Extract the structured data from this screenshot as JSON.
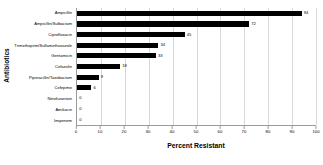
{
  "chart_data": {
    "type": "bar",
    "orientation": "horizontal",
    "title": "",
    "xlabel": "Percent Resistant",
    "ylabel": "Antibiotics",
    "categories": [
      "Ampicillin",
      "Ampicillin/Sulbactam",
      "Ciprofloxacin",
      "Trimethoprim/Sulfamethoxazole",
      "Gentamicin",
      "Cefazolin",
      "Piperacillin/Tazobactam",
      "Cefepime",
      "Nitrofurantoin",
      "Amikacin",
      "Imipenem"
    ],
    "values": [
      94,
      72,
      45,
      34,
      33,
      18,
      9,
      6,
      0,
      0,
      0
    ],
    "value_labels": [
      "94",
      "72",
      "45",
      "34",
      "33",
      "18",
      "9",
      "6",
      "0",
      "0",
      "0"
    ],
    "xlim": [
      0,
      100
    ],
    "xticks": [
      0,
      10,
      20,
      30,
      40,
      50,
      60,
      70,
      80,
      90,
      100
    ],
    "xtick_labels": [
      "0",
      "10",
      "20",
      "30",
      "40",
      "50",
      "60",
      "70",
      "80",
      "90",
      "100"
    ],
    "grid": "vertical",
    "legend": "none",
    "bar_color": "#000000",
    "gridline_color": "#d8d8d8",
    "axis_color": "#9a9a9a"
  }
}
